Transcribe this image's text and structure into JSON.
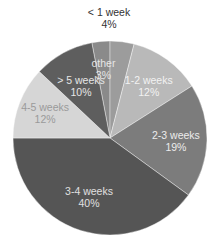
{
  "chart_data": {
    "type": "pie",
    "title": "",
    "start_angle_deg": -10.8,
    "direction": "clockwise",
    "slices": [
      {
        "label": "other",
        "value": 3,
        "pct_label": "3%",
        "color": "#8a8a8a",
        "text_color": "#e6e6e6",
        "label_inside": true
      },
      {
        "label": "< 1 week",
        "value": 4,
        "pct_label": "4%",
        "color": "#9c9c9c",
        "text_color": "#333333",
        "label_inside": false
      },
      {
        "label": "1-2 weeks",
        "value": 12,
        "pct_label": "12%",
        "color": "#b9b9b9",
        "text_color": "#f2f2f2",
        "label_inside": true
      },
      {
        "label": "2-3 weeks",
        "value": 19,
        "pct_label": "19%",
        "color": "#7c7c7c",
        "text_color": "#ececec",
        "label_inside": true
      },
      {
        "label": "3-4 weeks",
        "value": 40,
        "pct_label": "40%",
        "color": "#555555",
        "text_color": "#e0e0e0",
        "label_inside": true
      },
      {
        "label": "4-5 weeks",
        "value": 12,
        "pct_label": "12%",
        "color": "#d6d6d6",
        "text_color": "#9a9a9a",
        "label_inside": true
      },
      {
        "label": "> 5 weeks",
        "value": 10,
        "pct_label": "10%",
        "color": "#5e5e5e",
        "text_color": "#e6e6e6",
        "label_inside": true
      }
    ],
    "legend": "none",
    "grid": false
  },
  "layout": {
    "cx": 110,
    "cy": 138,
    "r": 97
  }
}
